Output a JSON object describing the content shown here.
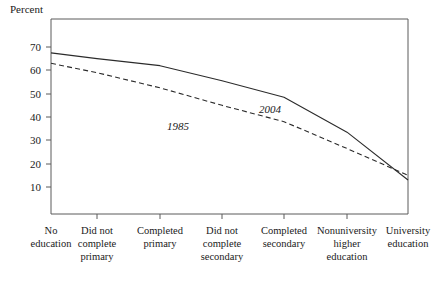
{
  "chart_data": {
    "type": "line",
    "title": "",
    "subtitle": "",
    "ylabel": "Percent",
    "xlabel": "",
    "ylim": [
      0,
      75
    ],
    "yticks": [
      10,
      20,
      30,
      40,
      50,
      60,
      70
    ],
    "ytick_labels": [
      "10",
      "20",
      "30",
      "40",
      "50",
      "60",
      "70"
    ],
    "grid": false,
    "legend_position": "inline-annotation",
    "categories": [
      "No education",
      "Did not complete primary",
      "Completed primary",
      "Did not complete secondary",
      "Completed secondary",
      "Nonuniversity higher education",
      "University education"
    ],
    "category_lines": [
      [
        "No",
        "education"
      ],
      [
        "Did not",
        "complete",
        "primary"
      ],
      [
        "Completed",
        "primary"
      ],
      [
        "Did not",
        "complete",
        "secondary"
      ],
      [
        "Completed",
        "secondary"
      ],
      [
        "Nonuniversity",
        "higher",
        "education"
      ],
      [
        "University",
        "education"
      ]
    ],
    "series": [
      {
        "name": "2004",
        "style": "solid",
        "annotation": "2004",
        "values": [
          67.5,
          65.0,
          62.0,
          55.5,
          48.5,
          33.5,
          13.0
        ]
      },
      {
        "name": "1985",
        "style": "dashed",
        "annotation": "1985",
        "values": [
          63.0,
          59.0,
          52.5,
          45.0,
          38.0,
          26.5,
          15.0
        ]
      }
    ],
    "annotations": [
      {
        "text": "1985",
        "series": "1985"
      },
      {
        "text": "2004",
        "series": "2004"
      }
    ]
  }
}
